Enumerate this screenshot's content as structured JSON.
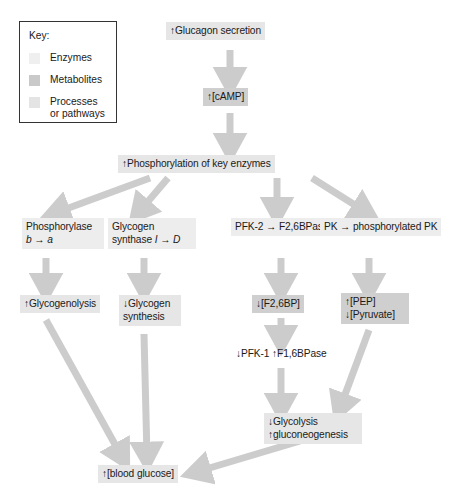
{
  "key": {
    "title": "Key:",
    "entries": [
      {
        "swatch": "enzyme-swatch",
        "label": "Enzymes"
      },
      {
        "swatch": "metabolite-swatch",
        "label": "Metabolites"
      },
      {
        "swatch": "process-swatch",
        "label": "Processes\nor pathways"
      }
    ]
  },
  "colors": {
    "enzyme_box": "#ededed",
    "metabolite_box": "#cfcfcf",
    "process_box": "#e6e6e6",
    "arrow": "#cccccc",
    "key_border": "#333333",
    "text": "#1a1a1a",
    "background": "#ffffff"
  },
  "nodes": {
    "glucagon": {
      "text": "↑Glucagon secretion",
      "type": "process"
    },
    "camp": {
      "text": "↑[cAMP]",
      "type": "metabolite"
    },
    "phosphorylation": {
      "text": "↑Phosphorylation of key enzymes",
      "type": "process"
    },
    "phosphorylase": {
      "line1": "Phosphorylase",
      "line2_pre": "b",
      "line2_arrow": " → ",
      "line2_post": "a",
      "type": "enzyme"
    },
    "glycogen_synthase": {
      "line1": "Glycogen",
      "line2_pre": "synthase ",
      "line2_a": "I",
      "line2_arrow": " → ",
      "line2_b": "D",
      "type": "enzyme"
    },
    "pfk2": {
      "text": "PFK-2 → F2,6BPase",
      "type": "enzyme"
    },
    "pk": {
      "text": "PK → phosphorylated PK",
      "type": "enzyme"
    },
    "glycogenolysis": {
      "text": "↑Glycogenolysis",
      "type": "process"
    },
    "glycogen_synthesis": {
      "line1": "↓Glycogen",
      "line2": "synthesis",
      "type": "process"
    },
    "f26bp": {
      "text": "↓[F2,6BP]",
      "type": "metabolite"
    },
    "pep_pyruvate": {
      "line1": "↑[PEP]",
      "line2": "↓[Pyruvate]",
      "type": "metabolite"
    },
    "pfk1_f16bpase": {
      "text": "↓PFK-1 ↑F1,6BPase",
      "type": "plain"
    },
    "glycolysis": {
      "line1": "↓Glycolysis",
      "line2": "↑gluconeogenesis",
      "type": "process"
    },
    "blood_glucose": {
      "text": "↑[blood glucose]",
      "type": "process"
    }
  },
  "edges": [
    {
      "from": "glucagon",
      "to": "camp"
    },
    {
      "from": "camp",
      "to": "phosphorylation"
    },
    {
      "from": "phosphorylation",
      "to": "phosphorylase"
    },
    {
      "from": "phosphorylation",
      "to": "glycogen_synthase"
    },
    {
      "from": "phosphorylation",
      "to": "pfk2"
    },
    {
      "from": "phosphorylation",
      "to": "pk"
    },
    {
      "from": "phosphorylase",
      "to": "glycogenolysis"
    },
    {
      "from": "glycogen_synthase",
      "to": "glycogen_synthesis"
    },
    {
      "from": "pfk2",
      "to": "f26bp"
    },
    {
      "from": "pk",
      "to": "pep_pyruvate"
    },
    {
      "from": "f26bp",
      "to": "pfk1_f16bpase"
    },
    {
      "from": "pfk1_f16bpase",
      "to": "glycolysis"
    },
    {
      "from": "pep_pyruvate",
      "to": "glycolysis"
    },
    {
      "from": "glycogenolysis",
      "to": "blood_glucose"
    },
    {
      "from": "glycogen_synthesis",
      "to": "blood_glucose"
    },
    {
      "from": "glycolysis",
      "to": "blood_glucose"
    }
  ]
}
